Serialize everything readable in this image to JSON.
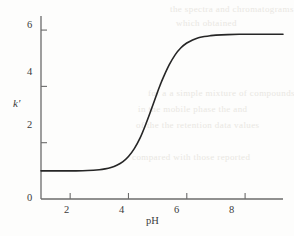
{
  "chart_data": {
    "type": "line",
    "title": "",
    "subtitle": "",
    "xlabel": "pH",
    "ylabel": "k′",
    "xlim": [
      1.0,
      9.3
    ],
    "ylim": [
      0,
      6.5
    ],
    "xticks": [
      2,
      4,
      6,
      8
    ],
    "yticks": [
      0,
      2,
      4,
      6
    ],
    "xtick_labels": [
      "2",
      "4",
      "6",
      "8"
    ],
    "ytick_labels": [
      "0",
      "2",
      "4",
      "6"
    ],
    "grid": false,
    "legend": null,
    "legend_position": "none",
    "annotations": [],
    "series": [
      {
        "name": "k′ vs pH",
        "color": "#262626",
        "line_width": 1.6,
        "lower_plateau": 1.0,
        "upper_plateau": 5.85,
        "inflection_ph": 5.1,
        "steepness": 1.45,
        "x": [
          1.0,
          1.4,
          1.8,
          2.2,
          2.6,
          3.0,
          3.2,
          3.4,
          3.6,
          3.8,
          4.0,
          4.2,
          4.4,
          4.6,
          4.8,
          5.0,
          5.1,
          5.2,
          5.4,
          5.6,
          5.8,
          6.0,
          6.2,
          6.4,
          6.6,
          6.8,
          7.0,
          7.4,
          7.8,
          8.2,
          8.6,
          9.0,
          9.3
        ],
        "y": [
          1.0,
          1.0,
          1.0,
          1.0,
          1.01,
          1.04,
          1.07,
          1.12,
          1.2,
          1.32,
          1.51,
          1.79,
          2.17,
          2.67,
          3.23,
          3.81,
          4.08,
          4.33,
          4.77,
          5.12,
          5.37,
          5.54,
          5.65,
          5.73,
          5.77,
          5.8,
          5.82,
          5.84,
          5.85,
          5.85,
          5.85,
          5.85,
          5.85
        ]
      }
    ],
    "axis_color": "#6b6b6b",
    "tick_color": "#6b6b6b"
  },
  "figure": {
    "x_axis_label": "pH",
    "y_axis_label": "k′",
    "x_tick_labels": [
      "2",
      "4",
      "6",
      "8"
    ],
    "y_tick_labels": [
      "0",
      "2",
      "4",
      "6"
    ],
    "background_bleed": [
      "the spectra and  chromatograms",
      "which  obtained",
      "for  a  a  simple  mixture  of  compounds",
      "in  the  mobile  phase  the  and",
      "of  the  the  retention  data  values",
      "compared  with  those  reported"
    ]
  }
}
